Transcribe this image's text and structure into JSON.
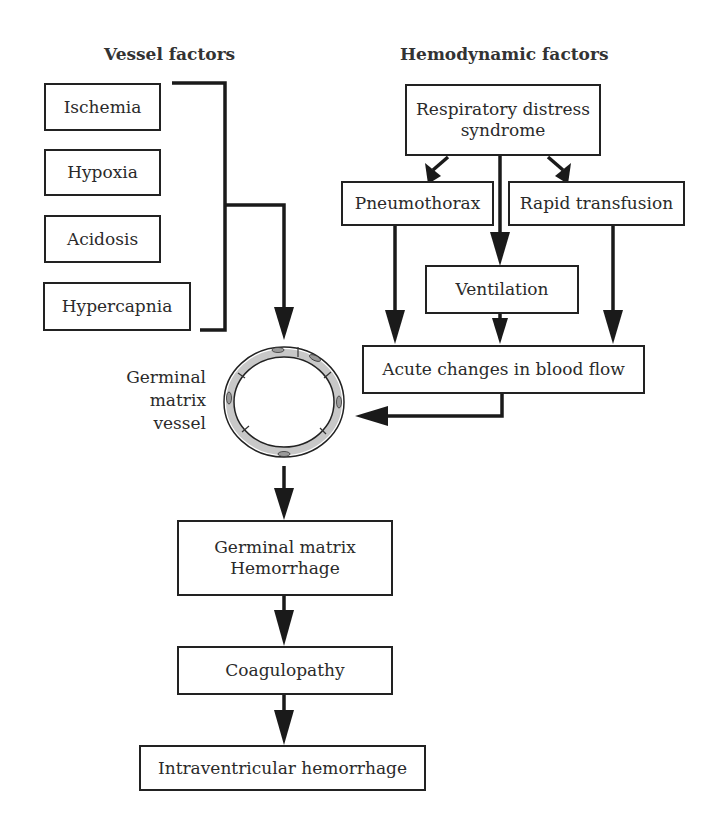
{
  "headings": {
    "vessel": "Vessel factors",
    "hemodynamic": "Hemodynamic factors"
  },
  "vessel_factors": [
    "Ischemia",
    "Hypoxia",
    "Acidosis",
    "Hypercapnia"
  ],
  "hemodynamic": {
    "rds_line1": "Respiratory distress",
    "rds_line2": "syndrome",
    "pneumothorax": "Pneumothorax",
    "rapid_transfusion": "Rapid transfusion",
    "ventilation": "Ventilation",
    "blood_flow": "Acute changes in blood flow"
  },
  "vessel_label": {
    "line1": "Germinal",
    "line2": "matrix",
    "line3": "vessel"
  },
  "outcome": {
    "gmh_line1": "Germinal matrix",
    "gmh_line2": "Hemorrhage",
    "coagulopathy": "Coagulopathy",
    "ivh": "Intraventricular hemorrhage"
  },
  "colors": {
    "stroke": "#1a1a1a",
    "vessel_wall": "#c8c8c8",
    "background": "#ffffff"
  }
}
